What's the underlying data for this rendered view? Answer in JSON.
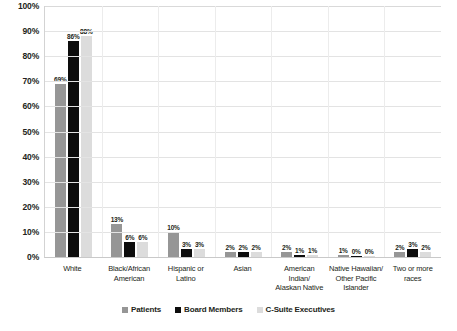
{
  "chart_data": {
    "type": "bar",
    "title": "",
    "subtitle": "",
    "xlabel": "",
    "ylabel": "",
    "ylim": [
      0,
      100
    ],
    "grid": true,
    "legend_position": "bottom",
    "y_ticks": [
      "100%",
      "90%",
      "80%",
      "70%",
      "60%",
      "50%",
      "40%",
      "30%",
      "20%",
      "10%",
      "0%"
    ],
    "y_tick_values": [
      100,
      90,
      80,
      70,
      60,
      50,
      40,
      30,
      20,
      10,
      0
    ],
    "categories": [
      "White",
      "Black/African American",
      "Hispanic or Latino",
      "Asian",
      "American Indian/ Alaskan Native",
      "Native Hawaiian/ Other Pacific Islander",
      "Two or more races"
    ],
    "category_lines": [
      [
        "White"
      ],
      [
        "Black/African",
        "American"
      ],
      [
        "Hispanic or",
        "Latino"
      ],
      [
        "Asian"
      ],
      [
        "American",
        "Indian/",
        "Alaskan Native"
      ],
      [
        "Native Hawaiian/",
        "Other Pacific",
        "Islander"
      ],
      [
        "Two or more",
        "races"
      ]
    ],
    "series": [
      {
        "name": "Patients",
        "color": "#969696",
        "values": [
          69,
          13,
          10,
          2,
          2,
          1,
          2
        ],
        "labels": [
          "69%",
          "13%",
          "10%",
          "2%",
          "2%",
          "1%",
          "2%"
        ]
      },
      {
        "name": "Board Members",
        "color": "#0d0d0d",
        "values": [
          86,
          6,
          3,
          2,
          1,
          0,
          3
        ],
        "labels": [
          "86%",
          "6%",
          "3%",
          "2%",
          "1%",
          "0%",
          "3%"
        ]
      },
      {
        "name": "C-Suite Executives",
        "color": "#dcdcdc",
        "values": [
          88,
          6,
          3,
          2,
          1,
          0,
          2
        ],
        "labels": [
          "88%",
          "6%",
          "3%",
          "2%",
          "1%",
          "0%",
          "2%"
        ]
      }
    ]
  },
  "legend": {
    "items": [
      {
        "label": "Patients",
        "color": "#969696"
      },
      {
        "label": "Board Members",
        "color": "#0d0d0d"
      },
      {
        "label": "C-Suite Executives",
        "color": "#dcdcdc"
      }
    ]
  },
  "colors": {
    "gridline": "#e3e3e3",
    "axis": "#c9c9c9",
    "text": "#231f20",
    "background": "#ffffff"
  }
}
